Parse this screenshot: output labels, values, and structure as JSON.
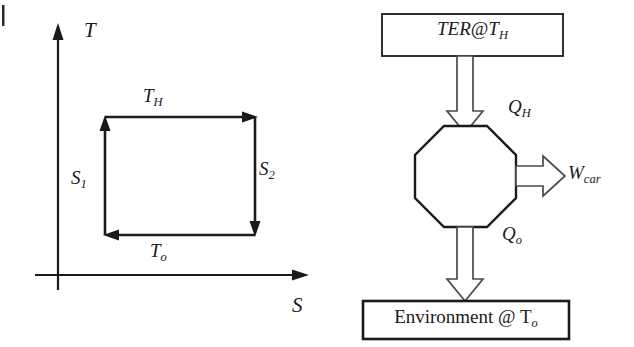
{
  "figure": {
    "type": "thermodynamics-diagram",
    "background_color": "#ffffff",
    "line_color": "#1a1a1a"
  },
  "ts_diagram": {
    "name": "temperature-entropy-carnot-cycle",
    "y_axis_label": "T",
    "x_axis_label": "S",
    "cycle_labels": {
      "top": "T",
      "top_sub": "H",
      "bottom": "T",
      "bottom_sub": "o",
      "left": "S",
      "left_sub": "1",
      "right": "S",
      "right_sub": "2"
    },
    "cycle_shape": "rectangle",
    "cycle_direction": "counterclockwise",
    "arrow_directions": [
      "up-left-edge",
      "right-top-edge",
      "down-right-edge",
      "left-bottom-edge"
    ]
  },
  "block_diagram": {
    "name": "heat-engine-energy-flow",
    "source_box": {
      "text_main": "TER@T",
      "text_sub": "H"
    },
    "sink_box": {
      "text_main": "Environment @ T",
      "text_sub": "o"
    },
    "engine_shape": "octagon",
    "flows": [
      {
        "name": "heat-input",
        "symbol": "Q",
        "sub": "H",
        "direction": "down"
      },
      {
        "name": "work-output",
        "symbol": "W",
        "sub": "car",
        "direction": "right"
      },
      {
        "name": "heat-rejected",
        "symbol": "Q",
        "sub": "o",
        "direction": "down"
      }
    ]
  }
}
